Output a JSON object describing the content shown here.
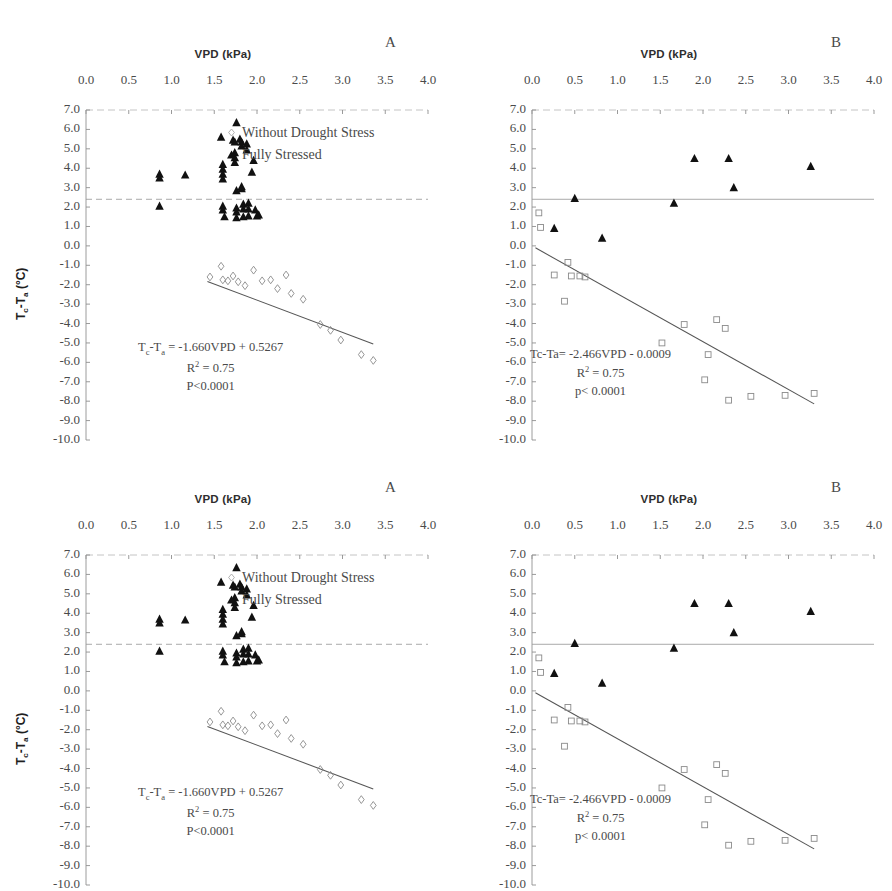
{
  "figure": {
    "panels": [
      {
        "id": "top-left",
        "letter": "A",
        "variant": "A"
      },
      {
        "id": "top-right",
        "letter": "B",
        "variant": "B"
      },
      {
        "id": "bottom-left",
        "letter": "A",
        "variant": "A"
      },
      {
        "id": "bottom-right",
        "letter": "B",
        "variant": "B"
      }
    ],
    "y_axis_label": "Tc-Ta (°C)",
    "y_axis_label_main": "T",
    "y_axis_label_sub1": "c",
    "y_axis_label_mid": "-T",
    "y_axis_label_sub2": "a",
    "y_axis_label_unit": " (°C)"
  },
  "chart_data": [
    {
      "type": "scatter",
      "panel": "A",
      "title": "",
      "xlabel": "VPD (kPa)",
      "ylabel": "Tc-Ta (°C)",
      "xlim": [
        0.0,
        4.0
      ],
      "ylim": [
        -10.0,
        7.0
      ],
      "xticks": [
        "0.0",
        "0.5",
        "1.0",
        "1.5",
        "2.0",
        "2.5",
        "3.0",
        "3.5",
        "4.0"
      ],
      "yticks": [
        "7.0",
        "6.0",
        "5.0",
        "4.0",
        "3.0",
        "2.0",
        "1.0",
        "0.0",
        "-1.0",
        "-2.0",
        "-3.0",
        "-4.0",
        "-5.0",
        "-6.0",
        "-7.0",
        "-8.0",
        "-9.0",
        "-10.0"
      ],
      "grid": false,
      "x_axis_position": "top",
      "legend": [
        {
          "label": "Without Drought Stress",
          "marker": "open-diamond"
        },
        {
          "label": "Fully Stressed",
          "marker": "filled-triangle"
        }
      ],
      "legend_position": "upper-right-inside",
      "reference_line": {
        "y": 2.4,
        "style": "dashed",
        "color": "#9a9a9a"
      },
      "series": [
        {
          "name": "Fully Stressed",
          "marker": "filled-triangle",
          "color": "#111111",
          "points": [
            [
              0.86,
              3.7
            ],
            [
              0.86,
              3.5
            ],
            [
              0.86,
              2.05
            ],
            [
              1.16,
              3.65
            ],
            [
              1.58,
              5.6
            ],
            [
              1.6,
              4.2
            ],
            [
              1.6,
              3.95
            ],
            [
              1.6,
              3.7
            ],
            [
              1.6,
              3.45
            ],
            [
              1.6,
              2.05
            ],
            [
              1.6,
              1.85
            ],
            [
              1.62,
              1.5
            ],
            [
              1.72,
              5.45
            ],
            [
              1.74,
              5.35
            ],
            [
              1.74,
              4.8
            ],
            [
              1.74,
              4.55
            ],
            [
              1.74,
              4.3
            ],
            [
              1.76,
              6.35
            ],
            [
              1.76,
              2.85
            ],
            [
              1.76,
              1.95
            ],
            [
              1.76,
              1.75
            ],
            [
              1.76,
              1.45
            ],
            [
              1.8,
              5.5
            ],
            [
              1.82,
              5.35
            ],
            [
              1.82,
              5.15
            ],
            [
              1.82,
              3.05
            ],
            [
              1.82,
              2.95
            ],
            [
              1.84,
              2.15
            ],
            [
              1.84,
              1.9
            ],
            [
              1.84,
              1.5
            ],
            [
              1.88,
              5.25
            ],
            [
              1.88,
              4.95
            ],
            [
              1.9,
              2.2
            ],
            [
              1.9,
              1.9
            ],
            [
              1.9,
              1.55
            ],
            [
              1.94,
              3.8
            ],
            [
              1.96,
              4.4
            ],
            [
              1.98,
              1.85
            ],
            [
              2.0,
              1.55
            ],
            [
              2.02,
              1.6
            ]
          ]
        },
        {
          "name": "Without Drought Stress",
          "marker": "open-diamond",
          "color": "#8a8a8a",
          "points": [
            [
              1.45,
              -1.6
            ],
            [
              1.58,
              -1.05
            ],
            [
              1.6,
              -1.75
            ],
            [
              1.66,
              -1.8
            ],
            [
              1.72,
              -1.55
            ],
            [
              1.78,
              -1.85
            ],
            [
              1.86,
              -2.05
            ],
            [
              1.96,
              -1.25
            ],
            [
              2.06,
              -1.8
            ],
            [
              2.16,
              -1.75
            ],
            [
              2.24,
              -2.2
            ],
            [
              2.34,
              -1.5
            ],
            [
              2.4,
              -2.45
            ],
            [
              2.54,
              -2.75
            ],
            [
              2.74,
              -4.05
            ],
            [
              2.86,
              -4.35
            ],
            [
              2.98,
              -4.85
            ],
            [
              3.22,
              -5.6
            ],
            [
              3.36,
              -5.9
            ]
          ]
        }
      ],
      "regression": {
        "equation": "Tc-Ta = -1.660VPD + 0.5267",
        "slope": -1.66,
        "intercept": 0.5267,
        "r_squared": "0.75",
        "r_squared_label": "R² = 0.75",
        "p_value_label": "P<0.0001",
        "x_start": 1.42,
        "x_end": 3.36,
        "color": "#555555"
      },
      "annotation_lines": {
        "line1_prefix": "T",
        "line1_sub1": "c",
        "line1_mid": "-T",
        "line1_sub2": "a",
        "line1_rest": " = -1.660VPD + 0.5267",
        "line2": "R² = 0.75",
        "line3": "P<0.0001"
      }
    },
    {
      "type": "scatter",
      "panel": "B",
      "title": "",
      "xlabel": "VPD (kPa)",
      "ylabel": "Tc-Ta (°C)",
      "xlim": [
        0.0,
        4.0
      ],
      "ylim": [
        -10.0,
        7.0
      ],
      "xticks": [
        "0.0",
        "0.5",
        "1.0",
        "1.5",
        "2.0",
        "2.5",
        "3.0",
        "3.5",
        "4.0"
      ],
      "yticks": [
        "7.0",
        "6.0",
        "5.0",
        "4.0",
        "3.0",
        "2.0",
        "1.0",
        "0.0",
        "-1.0",
        "-2.0",
        "-3.0",
        "-4.0",
        "-5.0",
        "-6.0",
        "-7.0",
        "-8.0",
        "-9.0",
        "-10.0"
      ],
      "grid": false,
      "x_axis_position": "top",
      "legend": [],
      "legend_position": "none",
      "reference_line": {
        "y": 2.4,
        "style": "solid",
        "color": "#9a9a9a"
      },
      "series": [
        {
          "name": "Fully Stressed",
          "marker": "filled-triangle",
          "color": "#111111",
          "points": [
            [
              0.26,
              0.9
            ],
            [
              0.5,
              2.45
            ],
            [
              0.82,
              0.4
            ],
            [
              1.66,
              2.2
            ],
            [
              1.9,
              4.5
            ],
            [
              2.3,
              4.5
            ],
            [
              2.36,
              3.0
            ],
            [
              3.26,
              4.1
            ]
          ]
        },
        {
          "name": "Without Drought Stress",
          "marker": "open-square",
          "color": "#8a8a8a",
          "points": [
            [
              0.08,
              1.7
            ],
            [
              0.1,
              0.95
            ],
            [
              0.26,
              -1.5
            ],
            [
              0.42,
              -0.85
            ],
            [
              0.46,
              -1.55
            ],
            [
              0.56,
              -1.55
            ],
            [
              0.62,
              -1.6
            ],
            [
              0.38,
              -2.85
            ],
            [
              1.52,
              -5.0
            ],
            [
              1.78,
              -4.05
            ],
            [
              2.02,
              -6.9
            ],
            [
              2.16,
              -3.8
            ],
            [
              2.26,
              -4.25
            ],
            [
              2.06,
              -5.6
            ],
            [
              2.3,
              -7.95
            ],
            [
              2.56,
              -7.75
            ],
            [
              2.96,
              -7.7
            ],
            [
              3.3,
              -7.6
            ]
          ]
        }
      ],
      "regression": {
        "equation": "Tc-Ta= -2.466VPD - 0.0009",
        "slope": -2.466,
        "intercept": -0.0009,
        "r_squared": "0.75",
        "r_squared_label": "R² = 0.75",
        "p_value_label": "p< 0.0001",
        "x_start": 0.04,
        "x_end": 3.3,
        "color": "#555555"
      },
      "annotation_lines": {
        "line1": "Tc-Ta= -2.466VPD - 0.0009",
        "line2": "R² = 0.75",
        "line3": "p< 0.0001"
      }
    }
  ]
}
